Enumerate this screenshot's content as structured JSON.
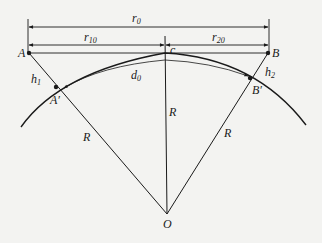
{
  "diagram": {
    "type": "geometry",
    "labels": {
      "r0": "r",
      "r0_sub": "0",
      "r10": "r",
      "r10_sub": "10",
      "r20": "r",
      "r20_sub": "20",
      "c": "c",
      "A": "A",
      "B": "B",
      "A_prime": "A",
      "A_prime_mark": "′",
      "B_prime": "B",
      "B_prime_mark": "′",
      "h1": "h",
      "h1_sub": "1",
      "h2": "h",
      "h2_sub": "2",
      "d0": "d",
      "d0_sub": "0",
      "R_left": "R",
      "R_center": "R",
      "R_right": "R",
      "O": "O"
    },
    "points": {
      "A": [
        29,
        53
      ],
      "B": [
        268,
        53
      ],
      "A_prime": [
        56,
        87
      ],
      "B_prime": [
        250,
        78
      ],
      "C_top": [
        165,
        53
      ],
      "O": [
        167,
        214
      ]
    },
    "colors": {
      "line": "#1a1a1a",
      "background": "#f3f3f1"
    }
  }
}
